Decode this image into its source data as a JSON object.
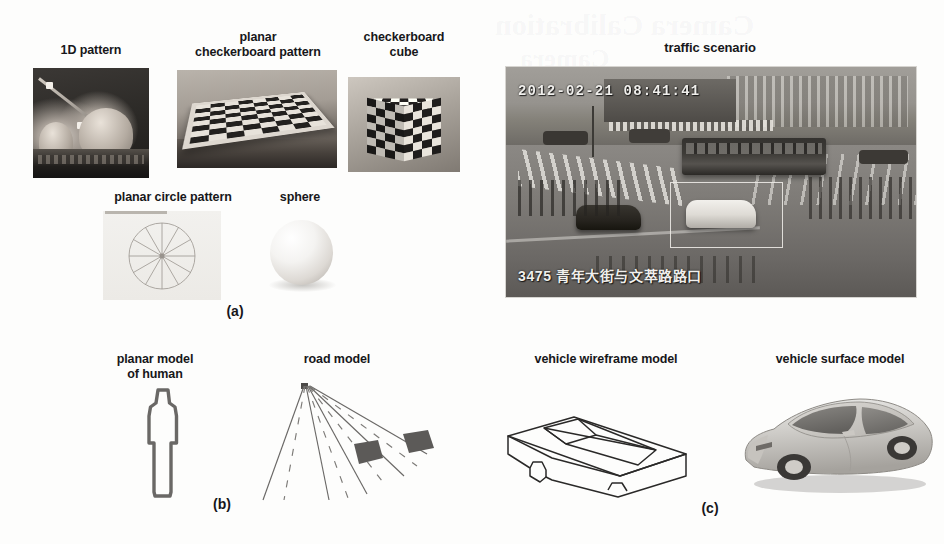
{
  "figure": {
    "panels": [
      {
        "id": "a",
        "label": "(a)",
        "items": [
          {
            "name": "1d-pattern",
            "caption": "1D pattern"
          },
          {
            "name": "planar-checkerboard-pattern",
            "caption": "planar\ncheckerboard pattern"
          },
          {
            "name": "checkerboard-cube",
            "caption": "checkerboard\ncube"
          },
          {
            "name": "planar-circle-pattern",
            "caption": "planar circle pattern"
          },
          {
            "name": "sphere",
            "caption": "sphere"
          }
        ]
      },
      {
        "id": "b",
        "label": "(b)",
        "items": [
          {
            "name": "planar-model-of-human",
            "caption": "planar model\nof human"
          },
          {
            "name": "road-model",
            "caption": "road model"
          }
        ]
      },
      {
        "id": "c",
        "label": "(c)",
        "items": [
          {
            "name": "vehicle-wireframe-model",
            "caption": "vehicle wireframe model"
          },
          {
            "name": "vehicle-surface-model",
            "caption": "vehicle surface model"
          }
        ]
      }
    ]
  },
  "captions": {
    "pattern_1d": "1D pattern",
    "planar_checkerboard_line1": "planar",
    "planar_checkerboard_line2": "checkerboard pattern",
    "checkerboard_cube_line1": "checkerboard",
    "checkerboard_cube_line2": "cube",
    "planar_circle_pattern": "planar circle pattern",
    "sphere": "sphere",
    "traffic_scenario": "traffic scenario",
    "planar_human_line1": "planar model",
    "planar_human_line2": "of human",
    "road_model": "road model",
    "vehicle_wireframe": "vehicle wireframe model",
    "vehicle_surface": "vehicle surface model"
  },
  "panel_labels": {
    "a": "(a)",
    "b": "(b)",
    "c": "(c)"
  },
  "traffic_overlay": {
    "timestamp": "2012-02-21 08:41:41",
    "camera_id_and_location": "3475 青年大街与文萃路路口"
  },
  "bleed_through": {
    "line1": "Camera Calibration",
    "line2": "Camera"
  },
  "colors": {
    "page_background": "#fdfdfc",
    "caption_text": "#17171a",
    "panel_label_text": "#16161a",
    "overlay_text": "#f0efec",
    "bbox_stroke": "#ecebe6",
    "line_art_stroke": "#5f5d5b",
    "road_vehicle_fill": "#5c5a58"
  }
}
